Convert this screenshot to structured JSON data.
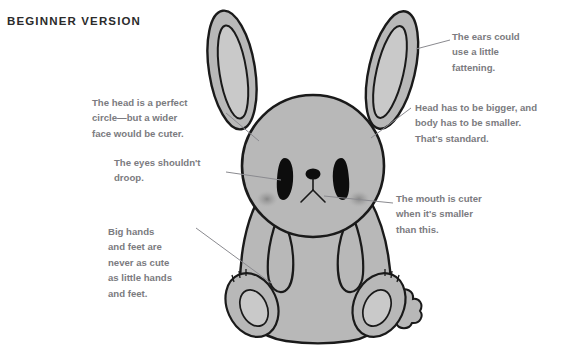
{
  "header": {
    "title": "BEGINNER VERSION"
  },
  "figure": {
    "colors": {
      "body_fill": "#b8b8b8",
      "inner_ear_fill": "#c9c9c9",
      "foot_pad_fill": "#c9c9c9",
      "outline": "#1a1a1a",
      "eye_fill": "#0d0d0d",
      "blush_fill": "#8e8e8e",
      "leader_line": "#8a8a8f",
      "title_text": "#2b2b2b",
      "callout_text": "#7b7b80",
      "background": "#ffffff"
    }
  },
  "callouts": [
    {
      "id": "head-shape",
      "name": "callout-head-shape",
      "text": "The head is a perfect\ncircle—but a wider\nface would be cuter.",
      "target": "head"
    },
    {
      "id": "ears",
      "name": "callout-ears",
      "text": "The ears could\nuse a little\nfattening.",
      "target": "right-ear"
    },
    {
      "id": "head-body-ratio",
      "name": "callout-head-body-ratio",
      "text": "Head has to be bigger, and\nbody has to be smaller.\nThat's standard.",
      "target": "head-right-side"
    },
    {
      "id": "eyes",
      "name": "callout-eyes",
      "text": "The eyes shouldn't\ndroop.",
      "target": "left-eye"
    },
    {
      "id": "mouth",
      "name": "callout-mouth",
      "text": "The mouth is cuter\nwhen it's smaller\nthan this.",
      "target": "mouth"
    },
    {
      "id": "hands-feet",
      "name": "callout-hands-feet",
      "text": "Big hands\nand feet are\nnever as cute\nas little hands\nand feet.",
      "target": "left-arm"
    }
  ]
}
